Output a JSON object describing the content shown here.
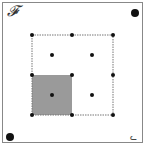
{
  "diagram": {
    "title_label": "𝓕",
    "corner_label": "ᓚ",
    "corner_dots": [
      {
        "x": 135,
        "y": 13,
        "r": 4
      },
      {
        "x": 10,
        "y": 137,
        "r": 4
      }
    ],
    "grid": {
      "x": [
        32,
        72,
        113
      ],
      "y": [
        35,
        75,
        115
      ]
    },
    "grid_dots": [
      {
        "x": 32,
        "y": 35
      },
      {
        "x": 72,
        "y": 35
      },
      {
        "x": 113,
        "y": 35
      },
      {
        "x": 32,
        "y": 75
      },
      {
        "x": 72,
        "y": 75
      },
      {
        "x": 113,
        "y": 75
      },
      {
        "x": 32,
        "y": 115
      },
      {
        "x": 72,
        "y": 115
      },
      {
        "x": 113,
        "y": 115
      }
    ],
    "center_dots": [
      {
        "x": 52,
        "y": 55
      },
      {
        "x": 92,
        "y": 55
      },
      {
        "x": 52,
        "y": 95
      },
      {
        "x": 92,
        "y": 95
      }
    ],
    "shaded_cell": {
      "x": 32,
      "y": 75,
      "w": 40,
      "h": 40,
      "color": "#9a9a9a"
    },
    "colors": {
      "dot": "#111111",
      "line": "#777777"
    }
  }
}
